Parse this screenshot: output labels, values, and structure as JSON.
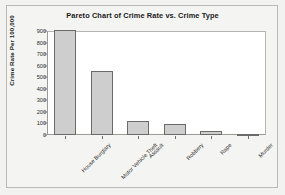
{
  "chart_data": {
    "type": "bar",
    "title": "Pareto Chart of Crime Rate vs. Crime Type",
    "xlabel": "",
    "ylabel": "Crime Rate Per 100,000",
    "categories": [
      "House Burglary",
      "Motor Vehicle Theft",
      "Assault",
      "Robbery",
      "Rape",
      "Murder"
    ],
    "values": [
      910,
      555,
      125,
      95,
      35,
      5
    ],
    "ylim": [
      0,
      900
    ],
    "yticks": [
      0,
      100,
      200,
      300,
      400,
      500,
      600,
      700,
      800,
      900
    ],
    "ytick_labels": [
      "0",
      "100",
      "200",
      "300",
      "400",
      "500",
      "600",
      "700",
      "800",
      "900"
    ],
    "grid": false,
    "legend": null,
    "bar_fill_color": "#cecece",
    "bar_edge_color": "#6a6a68",
    "plot_background": "#ffffff",
    "page_background": "#f2f2f0"
  }
}
